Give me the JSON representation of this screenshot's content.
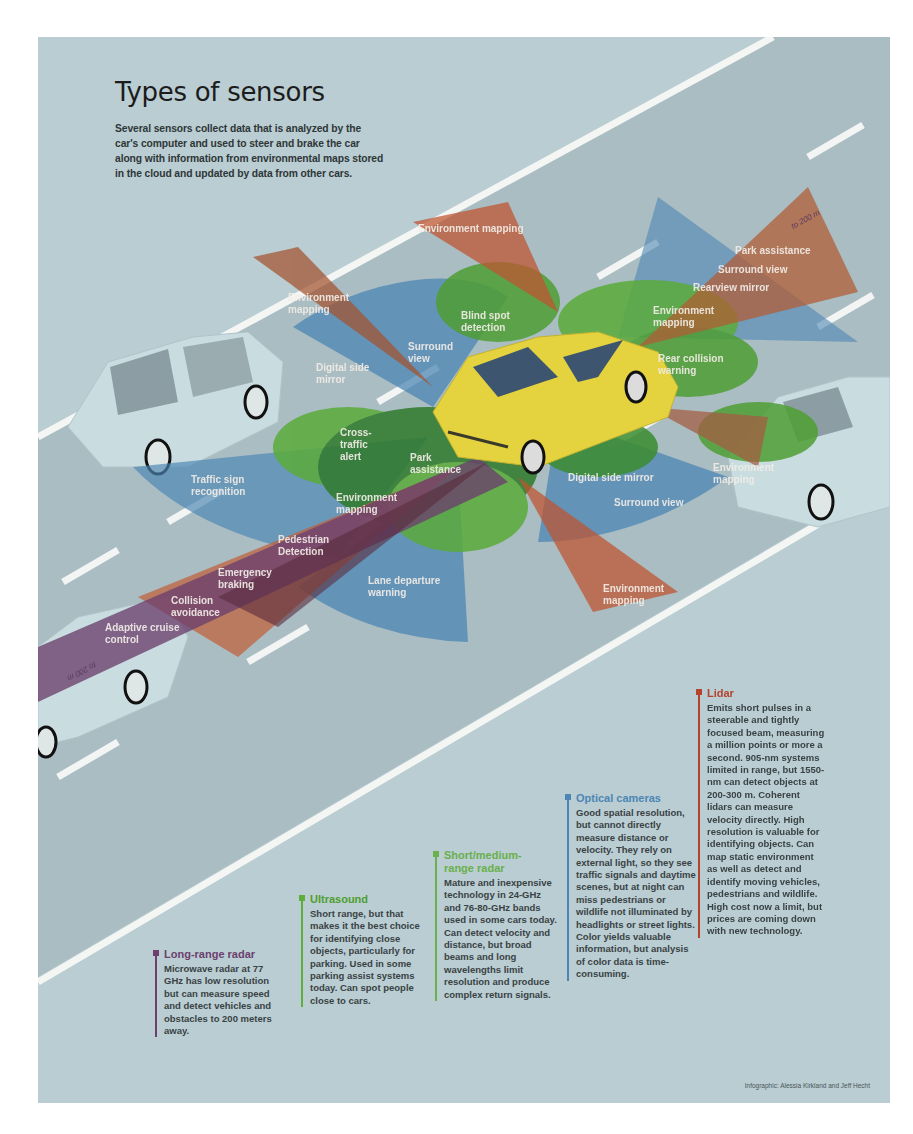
{
  "title": "Types of sensors",
  "intro": "Several sensors collect data that is analyzed by the car's computer and used to steer and brake the car along with information from environmental maps stored in the cloud and updated by data from other cars.",
  "colors": {
    "background": "#b9cdd2",
    "road": "#a9bcc2",
    "lane_marking": "#f4f6f4",
    "lidar": "#b5432e",
    "radar_long": "#6c3f6e",
    "radar_short": "#3f8a3a",
    "ultrasound": "#5fae3a",
    "camera": "#4d86b4",
    "subject_car": "#e4d33e",
    "other_cars": "#c9dde0"
  },
  "range_markers": {
    "front": "to 200 m",
    "rear": "to 200 m"
  },
  "diagram_labels": {
    "env_mapping_top": "Environment mapping",
    "env_mapping_left": "Environment mapping",
    "blind_spot": "Blind spot detection",
    "surround_view_left": "Surround view",
    "digital_side_mirror_left": "Digital side mirror",
    "park_assistance_rear": "Park assistance",
    "surround_view_rear": "Surround view",
    "rearview_mirror": "Rearview mirror",
    "env_mapping_rear": "Environment mapping",
    "rear_collision": "Rear collision warning",
    "cross_traffic": "Cross-traffic alert",
    "traffic_sign": "Traffic sign recognition",
    "park_assistance_front": "Park assistance",
    "env_mapping_front": "Environment mapping",
    "pedestrian": "Pedestrian Detection",
    "emergency_braking": "Emergency braking",
    "collision_avoidance": "Collision avoidance",
    "adaptive_cruise": "Adaptive cruise control",
    "lane_departure": "Lane departure warning",
    "digital_side_mirror_right": "Digital side mirror",
    "surround_view_right": "Surround view",
    "env_mapping_right": "Environment mapping",
    "env_mapping_bottom": "Environment mapping"
  },
  "sensors": [
    {
      "name": "Long-range radar",
      "color": "#6c3f6e",
      "description": "Microwave radar at 77 GHz has low resolution but can measure speed and detect vehicles and obstacles to 200 meters away."
    },
    {
      "name": "Ultrasound",
      "color": "#5fae3a",
      "description": "Short range, but that makes it the best choice for identifying close objects, particularly for parking. Used in some parking assist systems today. Can spot people close to cars."
    },
    {
      "name": "Short/medium-range radar",
      "color": "#6ab04c",
      "description": "Mature and inexpensive technology in 24-GHz and 76-80-GHz bands used in some cars today. Can detect velocity and distance, but broad beams and long wavelengths limit resolution and produce complex return signals."
    },
    {
      "name": "Optical cameras",
      "color": "#4d86b4",
      "description": "Good spatial resolution, but cannot directly measure distance or velocity. They rely on external light, so they see traffic signals and daytime scenes, but at night can miss pedestrians or wildlife not illuminated by headlights or street lights. Color yields valuable information, but analysis of color data is time-consuming."
    },
    {
      "name": "Lidar",
      "color": "#b5432e",
      "description": "Emits short pulses in a steerable and tightly focused beam, measuring a million points or more a second. 905-nm systems limited in range, but 1550-nm can detect objects at 200-300 m. Coherent lidars can measure velocity directly. High resolution is valuable for identifying objects. Can map static environment as well as detect and identify moving vehicles, pedestrians and wildlife. High cost now a limit, but prices are coming down with new technology."
    }
  ],
  "credit": "Infographic: Alessia Kirkland and Jeff Hecht"
}
